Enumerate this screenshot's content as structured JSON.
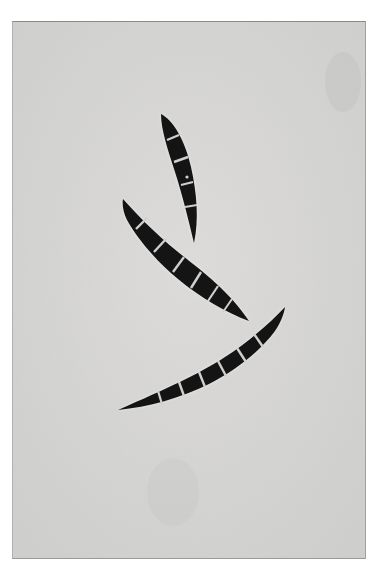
{
  "image": {
    "kind": "photomicrograph",
    "description": "Three septate crescent-shaped fungal macroconidia on a light gray background",
    "colors": {
      "page_background": "#ffffff",
      "field_background": "#d9d9d7",
      "spore_body": "#141414",
      "septum": "#cfcfcd",
      "frame_edge": "#8a8a88"
    },
    "spores": [
      {
        "name": "upper-spore",
        "septa_count": 4
      },
      {
        "name": "middle-spore",
        "septa_count": 6
      },
      {
        "name": "lower-spore",
        "septa_count": 6
      }
    ]
  }
}
